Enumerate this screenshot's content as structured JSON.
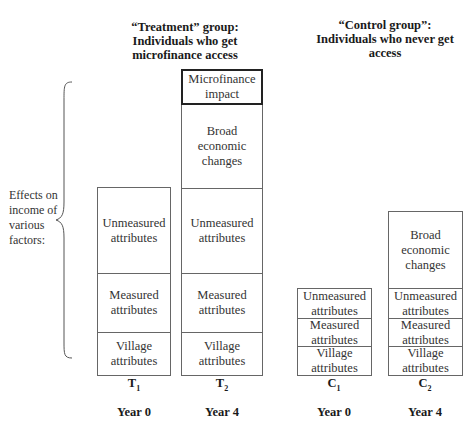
{
  "headings": {
    "treatment": "“Treatment” group: Individuals who get microfinance access",
    "treatment_lines": [
      "“Treatment” group:",
      "Individuals who get",
      "microfinance access"
    ],
    "control": "“Control group”: Individuals who never get access",
    "control_lines": [
      "“Control group”:",
      "Individuals who never get",
      "access"
    ]
  },
  "side_label": {
    "text": "Effects on income of various factors:",
    "lines": [
      "Effects on",
      "income of",
      "various",
      "factors:"
    ]
  },
  "columns": [
    {
      "id": "T1",
      "letter": "T",
      "sub": "1",
      "year": "Year 0",
      "segments": [
        {
          "label_lines": [
            "Unmeasured",
            "attributes"
          ],
          "label": "Unmeasured attributes"
        },
        {
          "label_lines": [
            "Measured",
            "attributes"
          ],
          "label": "Measured attributes"
        },
        {
          "label_lines": [
            "Village",
            "attributes"
          ],
          "label": "Village attributes"
        }
      ]
    },
    {
      "id": "T2",
      "letter": "T",
      "sub": "2",
      "year": "Year 4",
      "segments": [
        {
          "label_lines": [
            "Microfinance",
            "impact"
          ],
          "label": "Microfinance impact",
          "emphasized": true
        },
        {
          "label_lines": [
            "Broad",
            "economic",
            "changes"
          ],
          "label": "Broad economic changes"
        },
        {
          "label_lines": [
            "Unmeasured",
            "attributes"
          ],
          "label": "Unmeasured attributes"
        },
        {
          "label_lines": [
            "Measured",
            "attributes"
          ],
          "label": "Measured attributes"
        },
        {
          "label_lines": [
            "Village",
            "attributes"
          ],
          "label": "Village attributes"
        }
      ]
    },
    {
      "id": "C1",
      "letter": "C",
      "sub": "1",
      "year": "Year 0",
      "segments": [
        {
          "label_lines": [
            "Unmeasured",
            "attributes"
          ],
          "label": "Unmeasured attributes"
        },
        {
          "label_lines": [
            "Measured",
            "attributes"
          ],
          "label": "Measured attributes"
        },
        {
          "label_lines": [
            "Village",
            "attributes"
          ],
          "label": "Village attributes"
        }
      ]
    },
    {
      "id": "C2",
      "letter": "C",
      "sub": "2",
      "year": "Year 4",
      "segments": [
        {
          "label_lines": [
            "Broad",
            "economic",
            "changes"
          ],
          "label": "Broad economic changes"
        },
        {
          "label_lines": [
            "Unmeasured",
            "attributes"
          ],
          "label": "Unmeasured attributes"
        },
        {
          "label_lines": [
            "Measured",
            "attributes"
          ],
          "label": "Measured attributes"
        },
        {
          "label_lines": [
            "Village",
            "attributes"
          ],
          "label": "Village attributes"
        }
      ]
    }
  ]
}
